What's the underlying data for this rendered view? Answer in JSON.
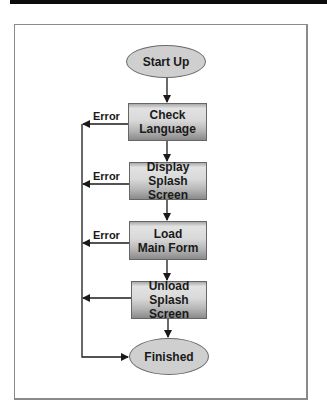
{
  "diagram": {
    "type": "flowchart",
    "nodes": [
      {
        "id": "start",
        "shape": "ellipse",
        "label": "Start Up"
      },
      {
        "id": "check",
        "shape": "box",
        "label_line1": "Check",
        "label_line2": "Language"
      },
      {
        "id": "display",
        "shape": "box",
        "label_line1": "Display",
        "label_line2": "Splash Screen"
      },
      {
        "id": "load",
        "shape": "box",
        "label_line1": "Load",
        "label_line2": "Main Form"
      },
      {
        "id": "unload",
        "shape": "box",
        "label_line1": "Unload",
        "label_line2": "Splash Screen"
      },
      {
        "id": "finished",
        "shape": "ellipse",
        "label": "Finished"
      }
    ],
    "edges": [
      {
        "from": "start",
        "to": "check"
      },
      {
        "from": "check",
        "to": "display"
      },
      {
        "from": "display",
        "to": "load"
      },
      {
        "from": "load",
        "to": "unload"
      },
      {
        "from": "unload",
        "to": "finished"
      },
      {
        "from": "check",
        "to": "finished",
        "label": "Error"
      },
      {
        "from": "display",
        "to": "finished",
        "label": "Error"
      },
      {
        "from": "load",
        "to": "finished",
        "label": "Error"
      },
      {
        "from": "unload",
        "to": "finished",
        "label": ""
      }
    ],
    "error_labels": [
      "Error",
      "Error",
      "Error"
    ]
  },
  "colors": {
    "ellipse_fill": "#cfcfcf",
    "box_gradient_top": "#e2e2e2",
    "box_gradient_bottom": "#8a8a8a",
    "line": "#1a1a1a",
    "frame_border": "#8a8a8a"
  }
}
